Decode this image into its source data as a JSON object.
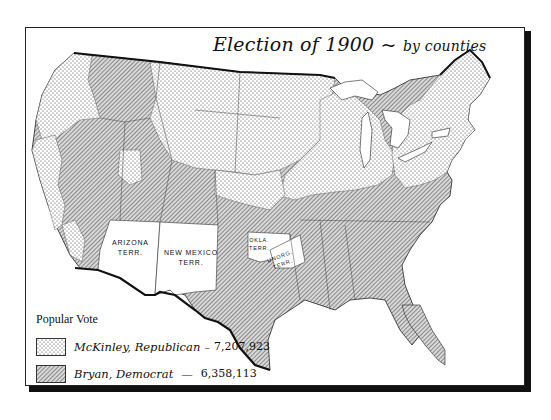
{
  "title": {
    "main": "Election of 1900",
    "separator": "~",
    "sub": "by counties"
  },
  "legend": {
    "title": "Popular Vote",
    "items": [
      {
        "label": "McKinley, Republican",
        "dash": "–",
        "votes": "7,207,923",
        "pattern": "stipple-dots"
      },
      {
        "label": "Bryan, Democrat",
        "dash": "—",
        "votes": "6,358,113",
        "pattern": "diagonal-hatch"
      }
    ]
  },
  "territories": [
    {
      "line1": "ARIZONA",
      "line2": "TERR."
    },
    {
      "line1": "NEW MEXICO",
      "line2": "TERR."
    },
    {
      "line1": "OKLA.",
      "line2": "TERR."
    },
    {
      "line1": "UNORG.",
      "line2": "TERR."
    }
  ],
  "colors": {
    "ink": "#111111",
    "paper": "#ffffff",
    "hatch": "#555555",
    "dots": "#444444"
  }
}
